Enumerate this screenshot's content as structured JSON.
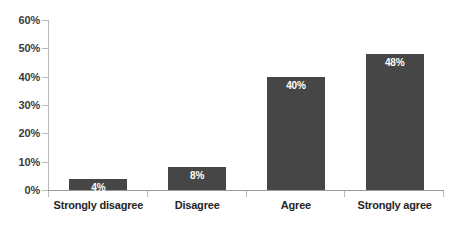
{
  "chart_data": {
    "type": "bar",
    "title": "",
    "subtitle": "",
    "xlabel": "",
    "ylabel": "",
    "categories": [
      "Strongly disagree",
      "Disagree",
      "Agree",
      "Strongly agree"
    ],
    "values": [
      4,
      8,
      40,
      48
    ],
    "data_labels": [
      "4%",
      "8%",
      "40%",
      "48%"
    ],
    "ylim": [
      0,
      60
    ],
    "ytick_values": [
      0,
      10,
      20,
      30,
      40,
      50,
      60
    ],
    "ytick_labels": [
      "0%",
      "10%",
      "20%",
      "30%",
      "40%",
      "50%",
      "60%"
    ],
    "grid": false,
    "legend": "none",
    "colors": {
      "bar": "#464646",
      "data_label": "#ffffff",
      "axis_line": "#b9b9b9",
      "baseline": "#9a9a9a",
      "tick_text": "#3b3b3b",
      "category_text": "#262626",
      "background": "#ffffff"
    }
  }
}
